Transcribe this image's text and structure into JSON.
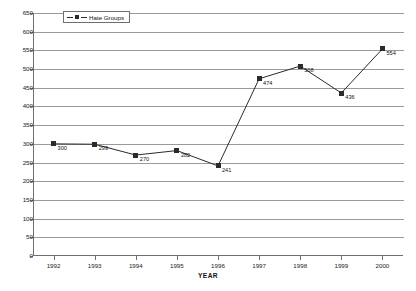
{
  "chart_data": {
    "type": "line",
    "title": "",
    "xlabel": "YEAR",
    "ylabel": "",
    "categories": [
      "1992",
      "1993",
      "1994",
      "1995",
      "1996",
      "1997",
      "1998",
      "1999",
      "2000"
    ],
    "values": [
      300,
      299,
      270,
      282,
      241,
      474,
      508,
      436,
      554
    ],
    "point_labels": [
      "300",
      "299",
      "270",
      "282",
      "241",
      "474",
      "508",
      "436",
      "554"
    ],
    "series": [
      {
        "name": "Hate Groups",
        "values": [
          300,
          299,
          270,
          282,
          241,
          474,
          508,
          436,
          554
        ]
      }
    ],
    "ylim": [
      0,
      650
    ],
    "ytick_step": 50,
    "yticks": [
      0,
      50,
      100,
      150,
      200,
      250,
      300,
      350,
      400,
      450,
      500,
      550,
      600,
      650
    ],
    "ytick_labels": [
      "0",
      "50",
      "100",
      "150",
      "200",
      "250",
      "300",
      "350",
      "400",
      "450",
      "500",
      "550",
      "600",
      "650"
    ],
    "grid": true,
    "legend_position": "top-left",
    "marker": "square",
    "colors": {
      "line": "#2b2b2b",
      "marker": "#2b2b2b",
      "grid": "#9a9a9a",
      "axis": "#6f6f6f",
      "background": "#ffffff",
      "text": "#111111"
    }
  },
  "legend": {
    "entries": [
      {
        "label": "Hate Groups"
      }
    ]
  }
}
